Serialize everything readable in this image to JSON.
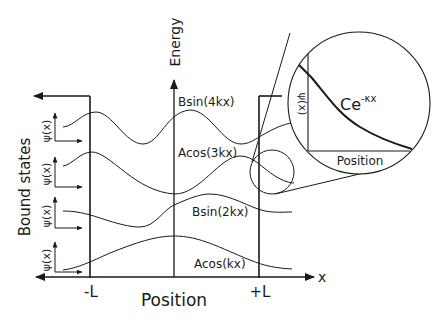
{
  "diagram": {
    "axes": {
      "vertical_label": "Energy",
      "horizontal_label": "Position",
      "x_label": "x",
      "left_boundary": "-L",
      "right_boundary": "+L",
      "side_label": "Bound states"
    },
    "wavefunctions": [
      {
        "label": "Bsin(4kx)",
        "axis_label": "ψ(x)"
      },
      {
        "label": "Acos(3kx)",
        "axis_label": "ψ(x)"
      },
      {
        "label": "Bsin(2kx)",
        "axis_label": "ψ(x)"
      },
      {
        "label": "Acos(kx)",
        "axis_label": "ψ(x)"
      }
    ],
    "inset": {
      "axis_label": "ψ(x)",
      "x_label": "Position",
      "curve_label_base": "Ce",
      "curve_label_exp": "-κx"
    }
  },
  "colors": {
    "line": "#1a1a1a",
    "background": "#ffffff"
  }
}
